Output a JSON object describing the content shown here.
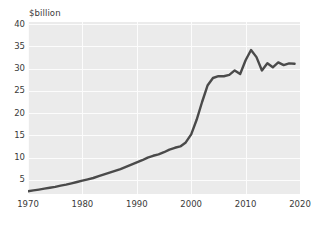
{
  "chart_data": {
    "type": "line",
    "title": "",
    "subtitle": "",
    "xlabel": "",
    "ylabel": "$billion",
    "unit_label": "$billion",
    "xlim": [
      1970,
      2020
    ],
    "ylim": [
      1.8,
      40.5
    ],
    "y_ticks": [
      5,
      10,
      15,
      20,
      25,
      30,
      35,
      40
    ],
    "y_tick_labels": [
      "5",
      "10",
      "15",
      "20",
      "25",
      "30",
      "35",
      "40"
    ],
    "x_ticks": [
      1970,
      1980,
      1990,
      2000,
      2010,
      2020
    ],
    "x_tick_labels": [
      "1970",
      "1980",
      "1990",
      "2000",
      "2010",
      "2020"
    ],
    "grid": true,
    "grid_color": "#fcfcfc",
    "plot_background": "#ebebeb",
    "legend": "none",
    "series": [
      {
        "name": "$billion",
        "color": "#4a4a4a",
        "line_width": 2.4,
        "x": [
          1970,
          1971,
          1972,
          1973,
          1974,
          1975,
          1976,
          1977,
          1978,
          1979,
          1980,
          1981,
          1982,
          1983,
          1984,
          1985,
          1986,
          1987,
          1988,
          1989,
          1990,
          1991,
          1992,
          1993,
          1994,
          1995,
          1996,
          1997,
          1998,
          1999,
          2000,
          2001,
          2002,
          2003,
          2004,
          2005,
          2006,
          2007,
          2008,
          2009,
          2010,
          2011,
          2012,
          2013,
          2014,
          2015,
          2016,
          2017,
          2018,
          2019
        ],
        "values": [
          2.4,
          2.6,
          2.8,
          3.0,
          3.2,
          3.4,
          3.7,
          3.9,
          4.2,
          4.5,
          4.8,
          5.1,
          5.4,
          5.8,
          6.2,
          6.6,
          7.0,
          7.4,
          7.9,
          8.4,
          8.9,
          9.4,
          10.0,
          10.4,
          10.7,
          11.2,
          11.8,
          12.2,
          12.5,
          13.4,
          15.2,
          18.5,
          22.5,
          26.2,
          27.9,
          28.3,
          28.3,
          28.6,
          29.6,
          28.8,
          31.9,
          34.2,
          32.6,
          29.6,
          31.2,
          30.3,
          31.4,
          30.8,
          31.2,
          31.1
        ]
      }
    ],
    "annotations": []
  },
  "colors": {
    "line": "#4a4a4a",
    "plot_bg": "#ebebeb",
    "grid": "#fcfcfc",
    "text": "#3a3a3a",
    "page_bg": "#ffffff"
  }
}
